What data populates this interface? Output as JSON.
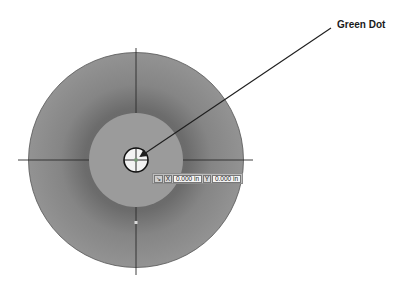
{
  "diagram": {
    "callout": {
      "label": "Green Dot"
    },
    "coordinate_readout": {
      "snap_icon": "↘",
      "x_label": "X",
      "x_value": "0.000 in",
      "y_label": "Y",
      "y_value": "0.000 in"
    },
    "colors": {
      "background": "#ffffff",
      "outer_disc": "#8e8e8e",
      "outer_disc_shadow": "#6f6f6f",
      "inner_disc": "#9a9a9a",
      "center_target": "#f2f2f2",
      "lines": "#2a2a2a"
    }
  }
}
